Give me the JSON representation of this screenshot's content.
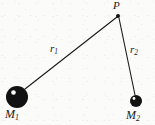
{
  "figure": {
    "background_color": "#fbfbfa",
    "ink_color": "#111111",
    "labels": {
      "point_p": "P",
      "r1_base": "r",
      "r1_sub": "1",
      "r2_base": "r",
      "r2_sub": "2",
      "m1_base": "M",
      "m1_sub": "1",
      "m2_base": "M",
      "m2_sub": "2"
    },
    "nodes": [
      {
        "name": "mass-1",
        "label": "M1",
        "cx": 17,
        "cy": 97,
        "r": 11,
        "fill": "#121212",
        "highlight": {
          "cx": 13.5,
          "cy": 92.5,
          "r": 2.3,
          "fill": "#ffffff"
        }
      },
      {
        "name": "mass-2",
        "label": "M2",
        "cx": 136,
        "cy": 101,
        "r": 6,
        "fill": "#121212",
        "highlight": {
          "cx": 134,
          "cy": 98.5,
          "r": 1.4,
          "fill": "#ffffff"
        }
      },
      {
        "name": "point-p",
        "label": "P",
        "cx": 118,
        "cy": 16,
        "r": 2,
        "fill": "#121212"
      }
    ],
    "segments": [
      {
        "name": "r1",
        "label": "r1",
        "from": "mass-1",
        "to": "point-p",
        "x1": 25,
        "y1": 89,
        "x2": 117,
        "y2": 17,
        "stroke": "#1a1a1a",
        "width": 1.1
      },
      {
        "name": "r2",
        "label": "r2",
        "from": "point-p",
        "to": "mass-2",
        "x1": 119,
        "y1": 18,
        "x2": 135,
        "y2": 95,
        "stroke": "#1a1a1a",
        "width": 1.1
      }
    ]
  }
}
